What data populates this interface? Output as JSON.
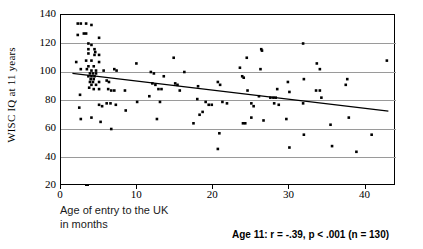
{
  "figure": {
    "background": "#ffffff",
    "frame_color": "#000000",
    "grid_color": "#9a9a9a",
    "marker_color": "#000000",
    "trend_color": "#000000"
  },
  "axes": {
    "y_title": "WISC IQ at 11 years",
    "x_title_line1": "Age of entry to the UK",
    "x_title_line2": "in months",
    "y_ticks": [
      "20",
      "40",
      "60",
      "80",
      "100",
      "120",
      "140"
    ],
    "x_ticks": [
      "0",
      "10",
      "20",
      "30",
      "40"
    ]
  },
  "annotation": {
    "stats": "Age 11: r = -.39, p < .001 (n = 130)"
  },
  "chart_data": {
    "type": "scatter",
    "title": "",
    "xlabel": "Age of entry to the UK in months",
    "ylabel": "WISC IQ at 11 years",
    "xlim": [
      0,
      44
    ],
    "ylim": [
      20,
      140
    ],
    "xticks": [
      0,
      10,
      20,
      30,
      40
    ],
    "yticks": [
      20,
      40,
      60,
      80,
      100,
      120,
      140
    ],
    "grid": "horizontal",
    "legend": "none",
    "annotations": [
      "Age 11: r = -.39, p < .001 (n = 130)"
    ],
    "stats": {
      "r": -0.39,
      "p": "< .001",
      "n": 130
    },
    "trendline": {
      "type": "linear",
      "x_start": 1.5,
      "y_start": 99.0,
      "x_end": 43.0,
      "y_end": 72.5
    },
    "points": [
      [
        2.2,
        134
      ],
      [
        2.6,
        134
      ],
      [
        3.3,
        134
      ],
      [
        2.2,
        126
      ],
      [
        3.0,
        127
      ],
      [
        3.3,
        127
      ],
      [
        4.0,
        133
      ],
      [
        5.0,
        124
      ],
      [
        3.6,
        120
      ],
      [
        4.0,
        119
      ],
      [
        3.6,
        116
      ],
      [
        4.4,
        116
      ],
      [
        4.5,
        114
      ],
      [
        3.6,
        113
      ],
      [
        4.4,
        112
      ],
      [
        5.0,
        112
      ],
      [
        2.0,
        107
      ],
      [
        3.3,
        108
      ],
      [
        4.0,
        108
      ],
      [
        5.0,
        107
      ],
      [
        3.6,
        104
      ],
      [
        4.3,
        104
      ],
      [
        2.6,
        102
      ],
      [
        3.4,
        102
      ],
      [
        4.0,
        101
      ],
      [
        4.6,
        101
      ],
      [
        5.6,
        101
      ],
      [
        3.8,
        99
      ],
      [
        4.2,
        99
      ],
      [
        4.6,
        99
      ],
      [
        3.6,
        97
      ],
      [
        4.0,
        97
      ],
      [
        4.4,
        97
      ],
      [
        3.9,
        95
      ],
      [
        4.3,
        95
      ],
      [
        3.8,
        93
      ],
      [
        4.2,
        93
      ],
      [
        5.0,
        93
      ],
      [
        4.0,
        91
      ],
      [
        4.6,
        91
      ],
      [
        3.7,
        89
      ],
      [
        4.3,
        88
      ],
      [
        5.0,
        88
      ],
      [
        6.0,
        94
      ],
      [
        6.3,
        93
      ],
      [
        7.0,
        102
      ],
      [
        7.3,
        101
      ],
      [
        6.2,
        88
      ],
      [
        6.6,
        87
      ],
      [
        7.0,
        87
      ],
      [
        8.4,
        87
      ],
      [
        9.9,
        106
      ],
      [
        10.0,
        79
      ],
      [
        8.5,
        73
      ],
      [
        6.0,
        78
      ],
      [
        6.5,
        78
      ],
      [
        7.2,
        77
      ],
      [
        5.0,
        77
      ],
      [
        5.4,
        76
      ],
      [
        2.5,
        84
      ],
      [
        2.4,
        75
      ],
      [
        2.6,
        67
      ],
      [
        4.0,
        68
      ],
      [
        5.2,
        65
      ],
      [
        6.6,
        60
      ],
      [
        11.8,
        100
      ],
      [
        12.2,
        99
      ],
      [
        12.0,
        92
      ],
      [
        12.4,
        91
      ],
      [
        11.6,
        83
      ],
      [
        12.8,
        88
      ],
      [
        13.2,
        88
      ],
      [
        13.5,
        97
      ],
      [
        13.0,
        79
      ],
      [
        12.6,
        67
      ],
      [
        14.8,
        110
      ],
      [
        15.0,
        92
      ],
      [
        15.3,
        91
      ],
      [
        15.6,
        87
      ],
      [
        16.2,
        100
      ],
      [
        17.4,
        64
      ],
      [
        17.9,
        81
      ],
      [
        18.0,
        90
      ],
      [
        18.2,
        70
      ],
      [
        18.6,
        72
      ],
      [
        19.0,
        79
      ],
      [
        19.4,
        77
      ],
      [
        19.8,
        77
      ],
      [
        20.6,
        93
      ],
      [
        20.9,
        91
      ],
      [
        21.2,
        79
      ],
      [
        21.8,
        78
      ],
      [
        20.8,
        57
      ],
      [
        20.6,
        46
      ],
      [
        23.5,
        103
      ],
      [
        23.8,
        97
      ],
      [
        24.0,
        96
      ],
      [
        24.4,
        110
      ],
      [
        24.5,
        87
      ],
      [
        23.9,
        64
      ],
      [
        24.2,
        64
      ],
      [
        25.0,
        78
      ],
      [
        25.3,
        76
      ],
      [
        25.0,
        68
      ],
      [
        26.3,
        116
      ],
      [
        26.4,
        115
      ],
      [
        26.2,
        102
      ],
      [
        26.0,
        83
      ],
      [
        26.6,
        66
      ],
      [
        27.5,
        82
      ],
      [
        27.9,
        82
      ],
      [
        28.2,
        82
      ],
      [
        28.4,
        88
      ],
      [
        28.0,
        78
      ],
      [
        28.6,
        77
      ],
      [
        29.8,
        93
      ],
      [
        30.0,
        86
      ],
      [
        29.6,
        67
      ],
      [
        30.0,
        47
      ],
      [
        31.8,
        120
      ],
      [
        31.9,
        95
      ],
      [
        31.8,
        78
      ],
      [
        31.9,
        56
      ],
      [
        33.6,
        106
      ],
      [
        34.0,
        102
      ],
      [
        33.5,
        87
      ],
      [
        34.0,
        87
      ],
      [
        34.2,
        82
      ],
      [
        35.4,
        63
      ],
      [
        35.6,
        48
      ],
      [
        37.6,
        95
      ],
      [
        37.4,
        91
      ],
      [
        37.8,
        68
      ],
      [
        38.8,
        44
      ],
      [
        40.8,
        56
      ],
      [
        42.8,
        108
      ]
    ]
  }
}
